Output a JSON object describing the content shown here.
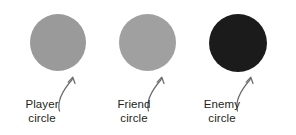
{
  "figure": {
    "background_color": "#ffffff",
    "text_color": "#231f20",
    "arrow_color": "#6e6b6b"
  },
  "items": [
    {
      "id": "player",
      "shape_name": "filled-circle",
      "fill_color": "#9a9a9a",
      "label_line1": "Player",
      "label_line2": "circle"
    },
    {
      "id": "friend",
      "shape_name": "filled-circle",
      "fill_color": "#a0a0a0",
      "label_line1": "Friend",
      "label_line2": "circle"
    },
    {
      "id": "enemy",
      "shape_name": "filled-circle",
      "fill_color": "#1b1b1b",
      "label_line1": "Enemy",
      "label_line2": "circle"
    }
  ]
}
